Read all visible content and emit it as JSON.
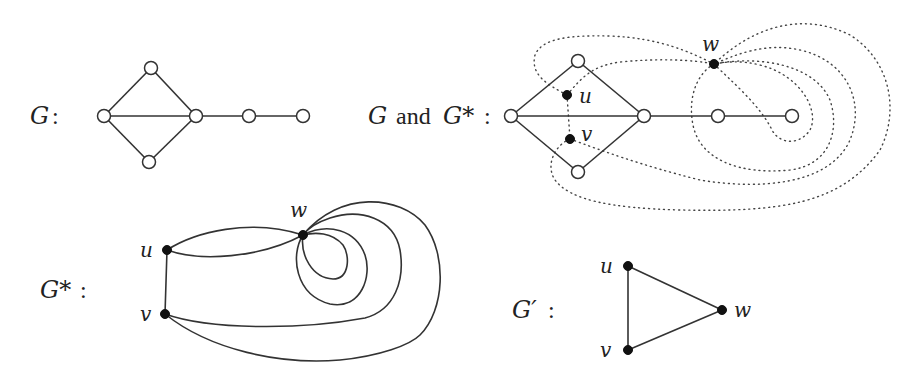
{
  "panels": {
    "g": {
      "label_var": "G",
      "label_sep": ":",
      "vertices": [
        "left",
        "top",
        "bottom",
        "hub",
        "mid",
        "end"
      ],
      "edges": [
        [
          "left",
          "top"
        ],
        [
          "left",
          "bottom"
        ],
        [
          "left",
          "hub"
        ],
        [
          "top",
          "hub"
        ],
        [
          "bottom",
          "hub"
        ],
        [
          "hub",
          "mid"
        ],
        [
          "mid",
          "end"
        ]
      ]
    },
    "g_and_dual": {
      "label_var1": "G",
      "label_and": "and",
      "label_var2": "G*",
      "label_sep": ":",
      "dual_vertices": {
        "u": "u",
        "v": "v",
        "w": "w"
      },
      "edge_style_primal": "solid",
      "edge_style_dual": "dotted"
    },
    "dual": {
      "label_var": "G*",
      "label_sep": ":",
      "vertices": {
        "u": "u",
        "v": "v",
        "w": "w"
      },
      "edges": [
        [
          "u",
          "w"
        ],
        [
          "u",
          "w"
        ],
        [
          "u",
          "v"
        ],
        [
          "v",
          "w"
        ],
        [
          "v",
          "w"
        ],
        [
          "w",
          "w"
        ],
        [
          "w",
          "w"
        ]
      ]
    },
    "simple": {
      "label_var": "G′",
      "label_sep": ":",
      "vertices": {
        "u": "u",
        "v": "v",
        "w": "w"
      },
      "edges": [
        [
          "u",
          "v"
        ],
        [
          "u",
          "w"
        ],
        [
          "v",
          "w"
        ]
      ]
    }
  },
  "colors": {
    "stroke": "#333333",
    "filled_vertex": "#111111",
    "open_vertex": "#ffffff",
    "background": "#ffffff"
  }
}
